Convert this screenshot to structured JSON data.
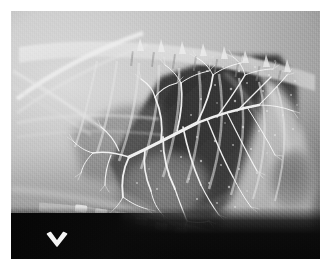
{
  "page": {
    "background_color": "#ffffff",
    "caption": ""
  },
  "radiograph": {
    "name": "lateral-thoracic-radiograph",
    "modality": "X-ray",
    "view": "right lateral",
    "region": "thorax",
    "study_type": "bronchogram",
    "frame": {
      "x": 11,
      "y": 11,
      "width": 309,
      "height": 248
    },
    "tone": {
      "film_base": "#8e8e8e",
      "soft_tissue_light": "#d9d9d9",
      "soft_tissue_mid": "#b2b2b2",
      "lung_dark": "#4a4a4a",
      "lung_darkest": "#2d2d2d",
      "collimation_black": "#0b0b0b",
      "bone_white": "#f2f2f2",
      "contrast_white": "#ffffff"
    },
    "anatomy": [
      {
        "label": "thoracic vertebral column",
        "position": "dorsal, upper band running left to right"
      },
      {
        "label": "ribs",
        "position": "radiating ventro-caudally from spine"
      },
      {
        "label": "scapula and forelimb",
        "position": "cranial, upper left oblique white bands"
      },
      {
        "label": "caudal lung lobe",
        "position": "large dark triangular field, centre to caudo-dorsal"
      },
      {
        "label": "bronchial tree filled with contrast",
        "position": "branching white arborisation through the lung field"
      },
      {
        "label": "cardiac silhouette",
        "position": "central ventral, mid grey ovoid"
      },
      {
        "label": "diaphragm",
        "position": "curved boundary, caudal right"
      },
      {
        "label": "liver / abdominal soft tissue",
        "position": "caudal to the diaphragm, right side"
      },
      {
        "label": "sternum / sternebrae",
        "position": "ventral, lower band of segmented opacities"
      },
      {
        "label": "gastric gas bubble",
        "position": "dark rounded lucency, caudo-ventral right"
      }
    ],
    "annotation": {
      "marker": "chevron-down-icon",
      "description": "white arrowhead marker pointing at the ventral structure",
      "color": "#f5f5f5",
      "x": 34,
      "y": 220,
      "width": 24,
      "height": 22
    }
  }
}
